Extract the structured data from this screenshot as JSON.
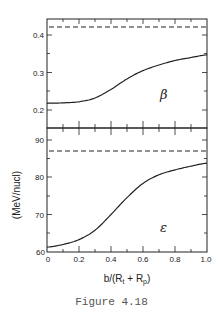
{
  "caption": "Figure 4.18",
  "chart_data": [
    {
      "type": "line",
      "panel": "top",
      "label": "β",
      "xlabel": "b/(R_t + R_p)",
      "ylabel": "",
      "xlim": [
        0,
        1.0
      ],
      "ylim": [
        0.185,
        0.43
      ],
      "yticks": [
        0.2,
        0.3,
        0.4
      ],
      "ytick_labels": [
        "0.2",
        "0.3",
        "0.4"
      ],
      "series": [
        {
          "name": "β",
          "style": "solid",
          "x": [
            0,
            0.1,
            0.2,
            0.3,
            0.4,
            0.5,
            0.6,
            0.7,
            0.8,
            0.9,
            1.0
          ],
          "values": [
            0.218,
            0.219,
            0.222,
            0.232,
            0.255,
            0.283,
            0.305,
            0.32,
            0.332,
            0.34,
            0.347
          ]
        },
        {
          "name": "limit",
          "style": "dashed",
          "x": [
            0,
            1.0
          ],
          "values": [
            0.42,
            0.42
          ]
        }
      ]
    },
    {
      "type": "line",
      "panel": "bottom",
      "label": "ε",
      "xlabel": "b/(R_t + R_p)",
      "ylabel": "(MeV/nucl)",
      "xlim": [
        0,
        1.0
      ],
      "ylim": [
        60,
        93
      ],
      "yticks": [
        60,
        70,
        80,
        90
      ],
      "ytick_labels": [
        "60",
        "70",
        "80",
        "90"
      ],
      "xticks": [
        0,
        0.2,
        0.4,
        0.6,
        0.8,
        1.0
      ],
      "xtick_labels": [
        "0",
        "0.2",
        "0.4",
        "0.6",
        "0.8",
        "1.0"
      ],
      "series": [
        {
          "name": "ε",
          "style": "solid",
          "x": [
            0,
            0.1,
            0.2,
            0.3,
            0.4,
            0.5,
            0.6,
            0.7,
            0.8,
            0.9,
            1.0
          ],
          "values": [
            61.3,
            62.0,
            63.3,
            65.8,
            70.0,
            74.5,
            78.3,
            80.6,
            81.9,
            82.9,
            83.7
          ]
        },
        {
          "name": "limit",
          "style": "dashed",
          "x": [
            0,
            1.0
          ],
          "values": [
            87,
            87
          ]
        }
      ]
    }
  ],
  "labels": {
    "beta": "β",
    "epsilon": "ε",
    "ylabel": "(MeV/nucl)",
    "xlabel_main": "b/(R",
    "xlabel_sub_t": "t",
    "xlabel_plus": " + R",
    "xlabel_sub_p": "p",
    "xlabel_close": ")"
  },
  "ticks": {
    "top_y": [
      "0.4",
      "0.3",
      "0.2"
    ],
    "bottom_y": [
      "90",
      "80",
      "70",
      "60"
    ],
    "x": [
      "0",
      "0.2",
      "0.4",
      "0.6",
      "0.8",
      "1.0"
    ]
  }
}
